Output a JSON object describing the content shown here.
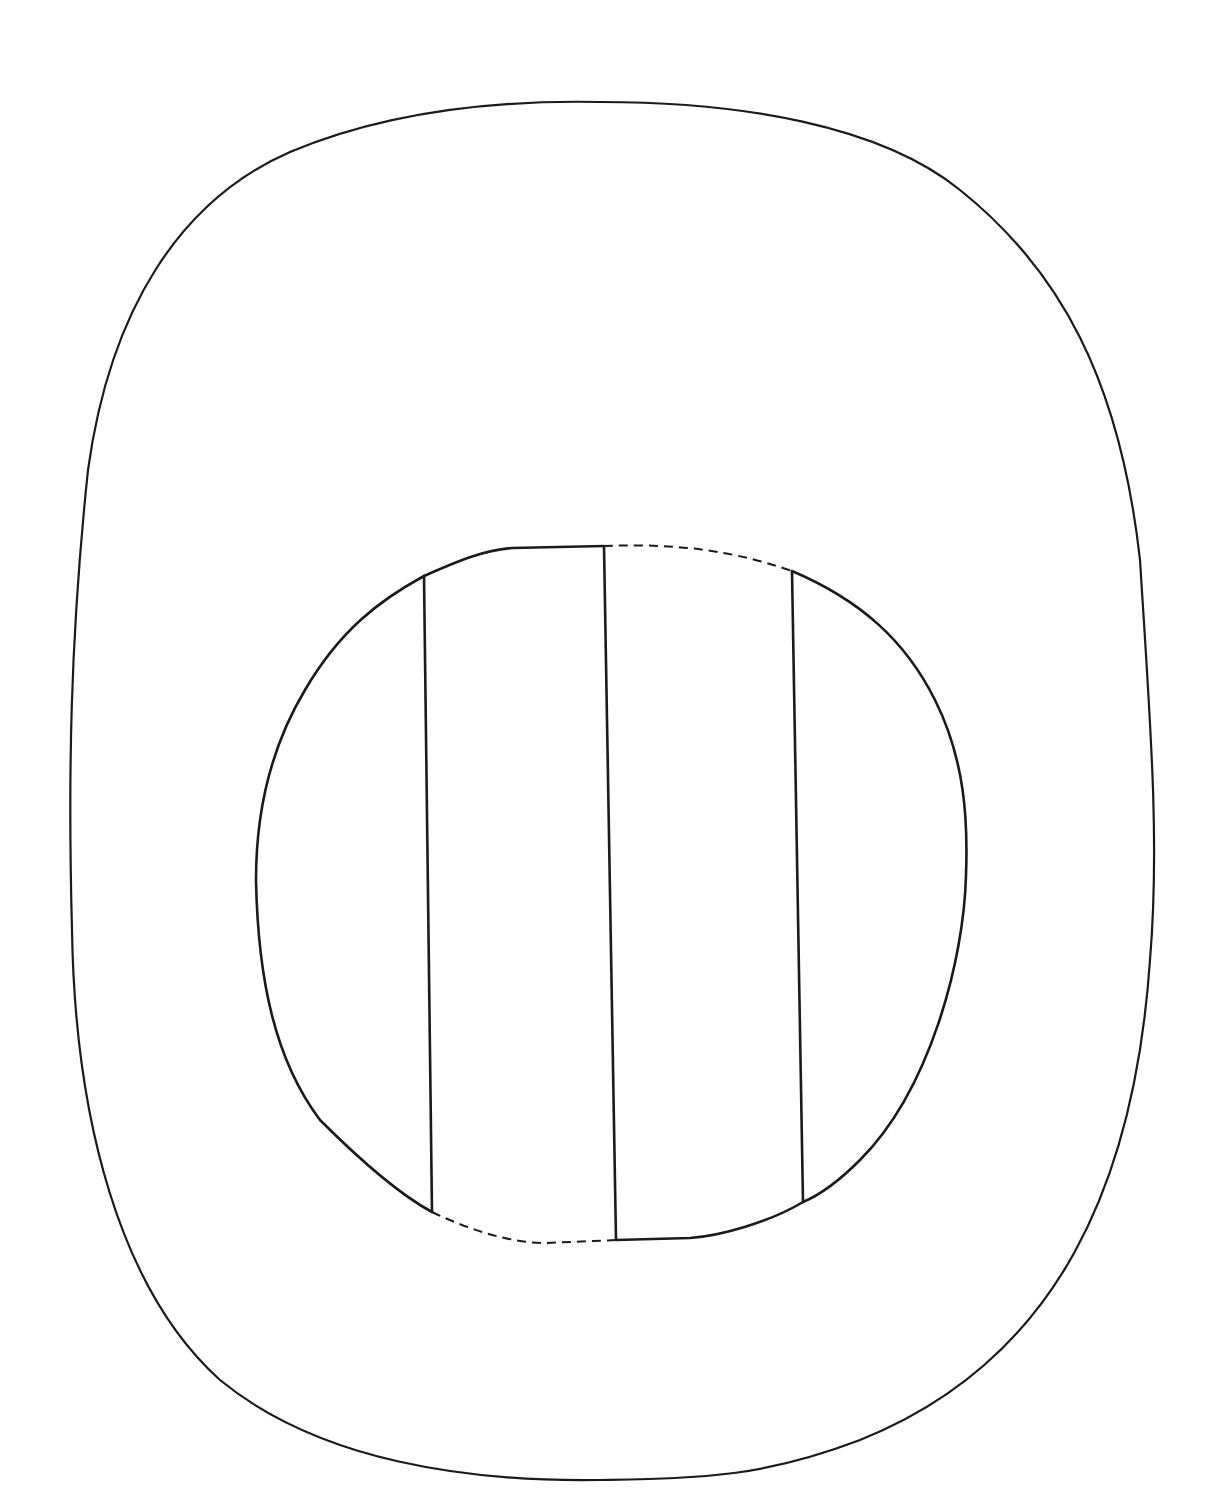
{
  "diagram": {
    "background": "#ffffff",
    "stroke_color": "#1a1a1a",
    "outer_shape": {
      "kind": "rounded-oval",
      "path": "M 600 102 C 740 102 880 125 960 190 C 1060 270 1120 380 1140 560 C 1150 720 1160 840 1150 960 C 1135 1180 1060 1360 860 1440 C 760 1478 700 1478 600 1480 C 470 1482 320 1462 220 1380 C 120 1290 75 1120 72 930 C 68 780 70 640 88 470 C 110 310 180 200 290 152 C 390 110 500 100 600 102 Z"
    },
    "inner_shape": {
      "kind": "rounded-circle",
      "solid_segments": [
        "M 424 576 C 460 560 485 550 512 548 L 604 546",
        "M 792 571 C 860 600 905 640 935 700 C 965 760 968 820 966 875 C 964 960 930 1090 860 1160 C 840 1180 820 1195 803 1202",
        "M 803 1202 C 770 1222 720 1236 690 1238 L 616 1240",
        "M 432 1212 C 395 1192 350 1150 320 1120 C 275 1060 258 980 256 880 C 256 800 275 740 305 690 C 340 630 380 600 424 576"
      ],
      "dashed_segments": [
        "M 604 546 C 660 544 720 546 792 571",
        "M 432 1212 C 470 1230 510 1243 545 1243 L 616 1240"
      ]
    },
    "vertical_dividers": [
      {
        "name": "divider-left",
        "x1": 424,
        "y1": 576,
        "x2": 432,
        "y2": 1212
      },
      {
        "name": "divider-center",
        "x1": 604,
        "y1": 546,
        "x2": 616,
        "y2": 1240
      },
      {
        "name": "divider-right",
        "x1": 792,
        "y1": 571,
        "x2": 803,
        "y2": 1202
      }
    ]
  }
}
